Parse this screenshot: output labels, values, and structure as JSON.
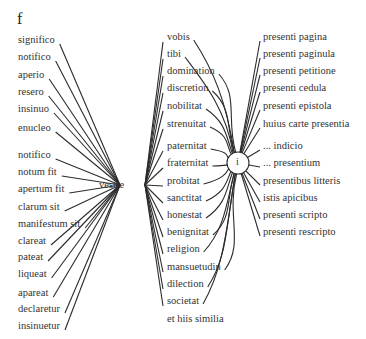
{
  "figure_label": "f",
  "hub_word": "vestre",
  "circle_node_label": "i",
  "left_column": [
    "significo",
    "notifico",
    "aperio",
    "resero",
    "insinuo",
    "enucleo",
    "notifico",
    "notum fit",
    "apertum fit",
    "clarum sit",
    "manifestum sit",
    "clareat",
    "pateat",
    "liqueat",
    "apareat",
    "declaretur",
    "insinuetur"
  ],
  "middle_column": [
    "vobis",
    "tibi",
    "domination",
    "discretion",
    "nobilitat",
    "strenuitat",
    "paternitat",
    "fraternitat",
    "probitat",
    "sanctitat",
    "honestat",
    "benignitat",
    "religion",
    "mansuetudin",
    "dilection",
    "societat",
    "et hiis similia"
  ],
  "right_column": [
    "presenti pagina",
    "presenti paginula",
    "presenti petitione",
    "presenti cedula",
    "presenti epistola",
    "huius carte presentia",
    "... indicio",
    "... presentium",
    "presentibus litteris",
    "istis apicibus",
    "presenti scripto",
    "presenti rescripto"
  ]
}
